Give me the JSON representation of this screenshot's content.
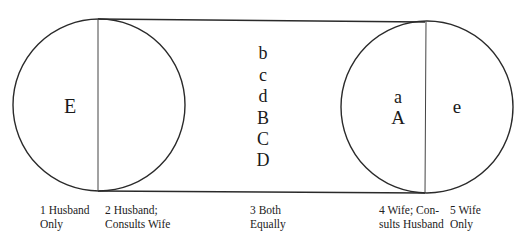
{
  "diagram": {
    "type": "decision-power continuum (circles joined by band)",
    "left_circle": {
      "outer_region_label": "E"
    },
    "center_band": {
      "labels": [
        "b",
        "c",
        "d",
        "B",
        "C",
        "D"
      ]
    },
    "right_circle": {
      "inner_region_labels": [
        "a",
        "A"
      ],
      "outer_region_label": "e"
    },
    "scale_captions": [
      {
        "line1": "1 Husband",
        "line2": "Only"
      },
      {
        "line1": "2 Husband;",
        "line2": "Consults Wife"
      },
      {
        "line1": "3 Both",
        "line2": "Equally"
      },
      {
        "line1": "4 Wife; Con-",
        "line2": "sults Husband"
      },
      {
        "line1": "5 Wife",
        "line2": "Only"
      }
    ],
    "colors": {
      "stroke": "#2a2a2a",
      "text": "#1a1a1a",
      "background": "#ffffff"
    }
  }
}
